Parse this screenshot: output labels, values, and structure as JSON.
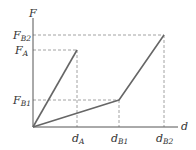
{
  "diagram": {
    "type": "force-displacement graph",
    "axes": {
      "y_label": "F",
      "x_label": "d"
    },
    "y_ticks": [
      {
        "base": "F",
        "sub": "B2"
      },
      {
        "base": "F",
        "sub": "A"
      },
      {
        "base": "F",
        "sub": "B1"
      }
    ],
    "x_ticks": [
      {
        "base": "d",
        "sub": "A"
      },
      {
        "base": "d",
        "sub": "B1"
      },
      {
        "base": "d",
        "sub": "B2"
      }
    ],
    "curves": [
      {
        "name": "A",
        "points": [
          [
            "0",
            "0"
          ],
          [
            "d_A",
            "F_A"
          ]
        ]
      },
      {
        "name": "B",
        "points": [
          [
            "0",
            "0"
          ],
          [
            "d_B1",
            "F_B1"
          ],
          [
            "d_B2",
            "F_B2"
          ]
        ]
      }
    ],
    "colors": {
      "axis": "#555555",
      "curve": "#666666",
      "dashed": "#888888"
    }
  }
}
